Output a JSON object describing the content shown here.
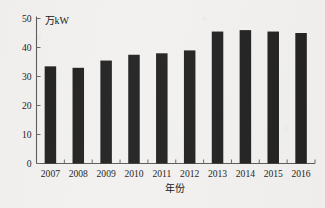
{
  "chart_data": {
    "type": "bar",
    "title": "",
    "subtitle": "",
    "xlabel": "年份",
    "ylabel": "万kW",
    "unit_label": "万kW",
    "categories": [
      "2007",
      "2008",
      "2009",
      "2010",
      "2011",
      "2012",
      "2013",
      "2014",
      "2015",
      "2016"
    ],
    "values": [
      33.5,
      33,
      35.5,
      37.5,
      38,
      39,
      45.5,
      46,
      45.5,
      45
    ],
    "series": [
      {
        "name": "装机容量",
        "values": [
          33.5,
          33,
          35.5,
          37.5,
          38,
          39,
          45.5,
          46,
          45.5,
          45
        ]
      }
    ],
    "ylim": [
      0,
      50
    ],
    "ytick_values": [
      0,
      10,
      20,
      30,
      40,
      50
    ],
    "ytick_labels": [
      "0",
      "10",
      "20",
      "30",
      "40",
      "50"
    ],
    "xtick_labels": [
      "2007",
      "2008",
      "2009",
      "2010",
      "2011",
      "2012",
      "2013",
      "2014",
      "2015",
      "2016"
    ],
    "grid": false,
    "legend": false,
    "legend_position": "none",
    "bar_color": "#232323",
    "axis_color": "#5d5c5a",
    "background_color": "#f2f1ef",
    "annotations": []
  },
  "figure": {
    "unit_annotation": "万kW",
    "x_axis_title": "年份"
  }
}
